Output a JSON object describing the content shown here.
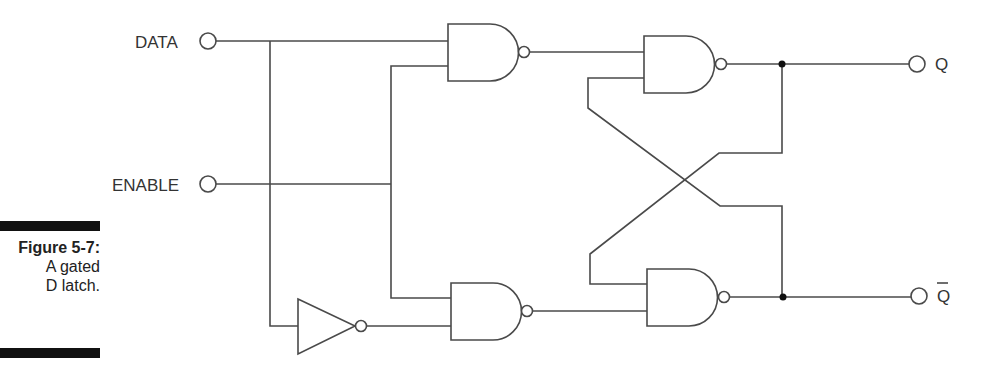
{
  "caption": {
    "figure_number": "Figure 5-7:",
    "line1": "A gated",
    "line2": "D latch."
  },
  "inputs": {
    "data_label": "DATA",
    "enable_label": "ENABLE"
  },
  "outputs": {
    "q_label": "Q",
    "q_bar_label": "Q",
    "q_bar_has_overline": true
  },
  "components": {
    "nand_gates": 4,
    "inverters": 1,
    "junction_dots": 2
  },
  "colors": {
    "wire": "#4a4a4a",
    "caption_bar": "#111111",
    "background": "#ffffff"
  }
}
